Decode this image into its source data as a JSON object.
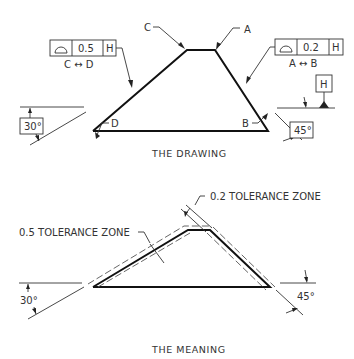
{
  "drawing": {
    "caption": "THE DRAWING",
    "point_labels": {
      "c": "C",
      "a": "A",
      "d": "D",
      "b": "B"
    },
    "fcf_left": {
      "symbol": "profile-of-a-line-icon",
      "tolerance": "0.5",
      "datum": "H",
      "between": "C ↔ D"
    },
    "fcf_right": {
      "symbol": "profile-of-a-line-icon",
      "tolerance": "0.2",
      "datum": "H",
      "between": "A ↔ B"
    },
    "datum_feature": "H",
    "angle_left": "30°",
    "angle_right": "45°"
  },
  "meaning": {
    "caption": "THE MEANING",
    "zone_left": "0.5 TOLERANCE ZONE",
    "zone_right": "0.2 TOLERANCE ZONE",
    "angle_left": "30°",
    "angle_right": "45°"
  },
  "colors": {
    "line": "#111111",
    "text": "#333333",
    "background": "#ffffff"
  }
}
